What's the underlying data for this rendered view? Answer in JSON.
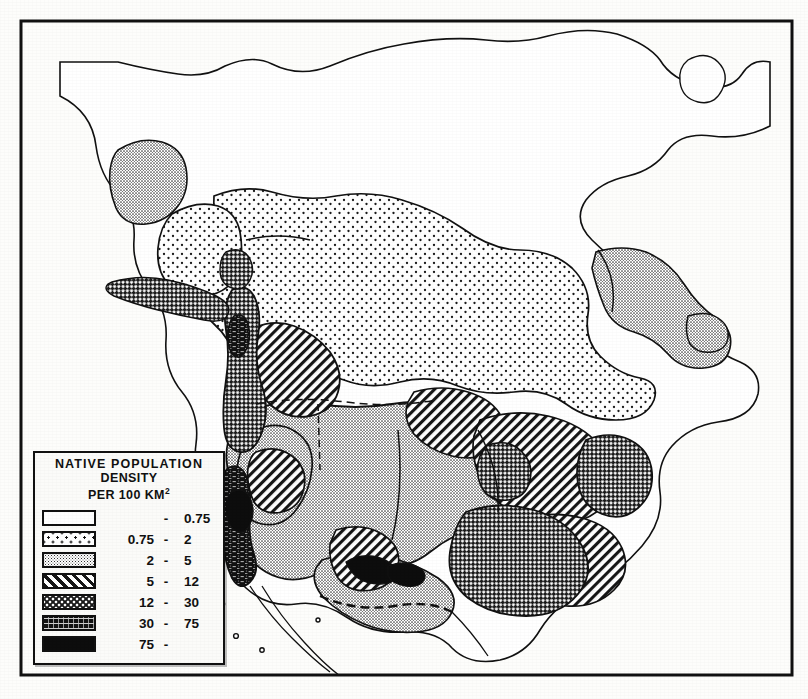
{
  "figure": {
    "kind": "thematic-choropleth-map",
    "region": "North America",
    "top_margin_artifact": "'⁄"
  },
  "legend": {
    "title_line1": "NATIVE  POPULATION",
    "title_line2": "DENSITY",
    "title_line3_prefix": "PER 100 KM",
    "title_line3_sup": "2",
    "dash": "-",
    "classes": [
      {
        "pattern": "white",
        "low": "",
        "high": "0.75"
      },
      {
        "pattern": "sparse-dots",
        "low": "0.75",
        "high": "2"
      },
      {
        "pattern": "fine-stipple",
        "low": "2",
        "high": "5"
      },
      {
        "pattern": "diagonal-hatch",
        "low": "5",
        "high": "12"
      },
      {
        "pattern": "crosshatch-dots",
        "low": "12",
        "high": "30"
      },
      {
        "pattern": "dark-speckle",
        "low": "30",
        "high": "75"
      },
      {
        "pattern": "solid-black",
        "low": "75",
        "high": ""
      }
    ]
  },
  "colors": {
    "ink": "#111111",
    "paper": "#fdfdfb",
    "fill_white": "#ffffff",
    "fill_sparse_dots": "#f2f2f0",
    "fill_fine_stipple": "#c9c9c7",
    "fill_diagonal_hatch": "#bdbdbb",
    "fill_crosshatch": "#8f8f8d",
    "fill_dark_speckle": "#5a5a58",
    "fill_black": "#0d0d0d"
  },
  "map_regions": [
    {
      "name": "greenland",
      "class_index": 0
    },
    {
      "name": "arctic-archipelago",
      "class_index": 0
    },
    {
      "name": "hudson-bay-interior",
      "class_index": 0
    },
    {
      "name": "boreal-canada",
      "class_index": 1
    },
    {
      "name": "alaska-interior",
      "class_index": 1
    },
    {
      "name": "alaska-west-coast",
      "class_index": 2
    },
    {
      "name": "labrador-coast",
      "class_index": 2
    },
    {
      "name": "great-plains",
      "class_index": 2
    },
    {
      "name": "great-basin",
      "class_index": 2
    },
    {
      "name": "mexico-plateau",
      "class_index": 2
    },
    {
      "name": "columbia-plateau",
      "class_index": 3
    },
    {
      "name": "southeast-woodlands",
      "class_index": 3
    },
    {
      "name": "great-lakes-east",
      "class_index": 3
    },
    {
      "name": "aleutian-chain",
      "class_index": 4
    },
    {
      "name": "northwest-coast",
      "class_index": 4
    },
    {
      "name": "mississippian-south",
      "class_index": 4
    },
    {
      "name": "atlantic-northeast",
      "class_index": 4
    },
    {
      "name": "california-coast",
      "class_index": 5
    },
    {
      "name": "california-central",
      "class_index": 6
    },
    {
      "name": "southwest-pueblo",
      "class_index": 6
    }
  ]
}
